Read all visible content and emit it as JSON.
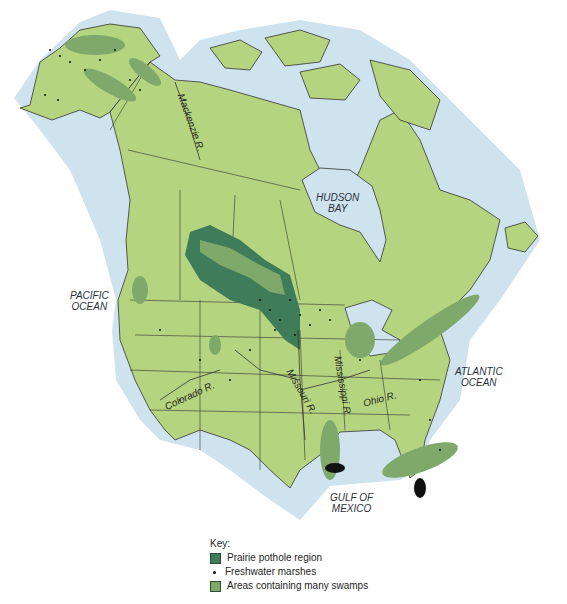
{
  "colors": {
    "land": "#b5d47f",
    "water": "#cfe3ef",
    "prairie_pothole": "#3e7c5a",
    "swamps": "#7ea96b",
    "marsh_dot": "#111111",
    "border": "#333333"
  },
  "labels": {
    "pacific": "PACIFIC\nOCEAN",
    "pacific_line1": "PACIFIC",
    "pacific_line2": "OCEAN",
    "atlantic_line1": "ATLANTIC",
    "atlantic_line2": "OCEAN",
    "hudson_line1": "HUDSON",
    "hudson_line2": "BAY",
    "gulf_line1": "GULF OF",
    "gulf_line2": "MEXICO"
  },
  "rivers": {
    "mackenzie": "Mackenzie R.",
    "colorado": "Colorado R.",
    "missouri": "Missouri R.",
    "mississippi": "Mississippi R.",
    "ohio": "Ohio R."
  },
  "key": {
    "title": "Key:",
    "items": [
      {
        "symbol": "swatch",
        "color": "#3e7c5a",
        "label": "Prairie pothole region"
      },
      {
        "symbol": "dot",
        "color": "#111111",
        "label": "Freshwater marshes"
      },
      {
        "symbol": "swatch",
        "color": "#7ea96b",
        "label": "Areas containing many swamps"
      }
    ]
  }
}
